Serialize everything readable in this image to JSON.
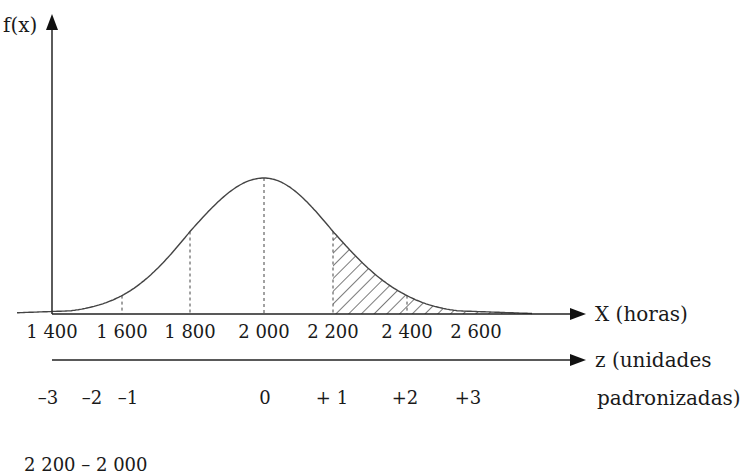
{
  "chart_data": {
    "type": "area",
    "title": "",
    "ylabel": "f(x)",
    "xlabel": "X (horas)",
    "x2label_line1": "z (unidades",
    "x2label_line2": "padronizadas)",
    "distribution": "normal",
    "mean": 2000,
    "std": 200,
    "x_ticks": [
      "1 400",
      "1 600",
      "1 800",
      "2 000",
      "2 200",
      "2 400",
      "2 600"
    ],
    "x_values": [
      1400,
      1600,
      1800,
      2000,
      2200,
      2400,
      2600
    ],
    "z_ticks": [
      "–3",
      "–2",
      "–1",
      "0",
      "+ 1",
      "+2",
      "+3"
    ],
    "z_values": [
      -3,
      -2,
      -1,
      0,
      1,
      2,
      3
    ],
    "dashed_verticals_at": [
      1600,
      1800,
      2000,
      2200,
      2400
    ],
    "shaded_region": {
      "from": 2200,
      "to": "inf",
      "pattern": "diagonal hatch",
      "meaning": "P(X > 2200)"
    },
    "grid": false,
    "legend": null
  },
  "footer_formula_partial": "2 200 – 2 000"
}
